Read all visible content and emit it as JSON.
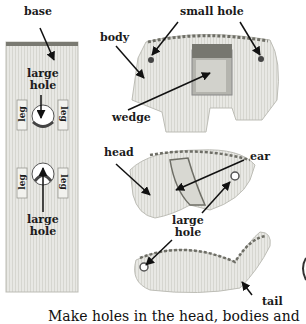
{
  "diagram": {
    "labels": {
      "base": "base",
      "large_hole_top": [
        "large",
        "hole"
      ],
      "large_hole_bottom": [
        "large",
        "hole"
      ],
      "leg": "leg",
      "body": "body",
      "small_hole": "small hole",
      "wedge": "wedge",
      "head": "head",
      "ear": "ear",
      "large_hole_head": [
        "large",
        "hole"
      ],
      "tail": "tail"
    },
    "caption": "Make holes in the head, bodies and"
  },
  "colors": {
    "cardboard": "#e6e6e2",
    "cardboard_shadow": "#c9c9c4",
    "corrugated_edge": "#6e6e66",
    "text": "#1a1a1a"
  }
}
